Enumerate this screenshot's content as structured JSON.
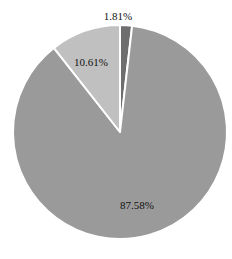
{
  "chart_data": {
    "type": "pie",
    "title": "",
    "categories": [
      "Slice A",
      "Slice B",
      "Slice C"
    ],
    "values": [
      1.81,
      87.58,
      10.61
    ],
    "labels": [
      "1.81%",
      "87.58%",
      "10.61%"
    ],
    "colors": [
      "#6e6e6e",
      "#9a9a9a",
      "#c0c0c0"
    ],
    "start_angle_deg": 0,
    "direction": "clockwise",
    "legend": "none",
    "separator_color": "#ffffff"
  },
  "layout": {
    "cx": 120,
    "cy": 132,
    "r": 107,
    "label_positions": [
      {
        "x": 118,
        "y": 20
      },
      {
        "x": 137,
        "y": 209
      },
      {
        "x": 91,
        "y": 66
      }
    ]
  }
}
